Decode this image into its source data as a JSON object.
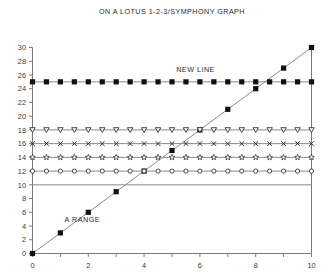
{
  "chart_data": {
    "type": "line",
    "title": "ON A LOTUS 1-2-3/SYMPHONY GRAPH",
    "xlabel": "",
    "ylabel": "",
    "xlim": [
      0,
      10
    ],
    "ylim": [
      0,
      30
    ],
    "grid": false,
    "legend_position": "none",
    "xticks": [
      0,
      1,
      2,
      3,
      4,
      5,
      6,
      7,
      8,
      9,
      10
    ],
    "xticklabels": [
      "0",
      "",
      "2",
      "",
      "4",
      "",
      "6",
      "",
      "8",
      "",
      "10"
    ],
    "yticks": [
      0,
      2,
      4,
      6,
      8,
      10,
      12,
      14,
      16,
      18,
      20,
      22,
      24,
      26,
      28,
      30
    ],
    "yticklabels": [
      "0",
      "2",
      "4",
      "6",
      "8",
      "10",
      "12",
      "14",
      "16",
      "18",
      "20",
      "22",
      "24",
      "26",
      "28",
      "30"
    ],
    "annotations": [
      {
        "text": "A RANGE",
        "x": 1.15,
        "y": 4.6
      },
      {
        "text": "NEW LINE",
        "x": 5.15,
        "y": 26.4
      }
    ],
    "series": [
      {
        "name": "A RANGE",
        "marker": "filled-square",
        "x": [
          0,
          1,
          2,
          3,
          4,
          5,
          6,
          7,
          8,
          9,
          10
        ],
        "values": [
          0,
          3,
          6,
          9,
          12,
          15,
          18,
          21,
          24,
          27,
          30
        ]
      },
      {
        "name": "NEW LINE",
        "marker": "filled-square",
        "x": [
          0,
          0.5,
          1,
          1.5,
          2,
          2.5,
          3,
          3.5,
          4,
          4.5,
          5,
          5.5,
          6,
          6.5,
          7,
          7.5,
          8,
          8.5,
          9,
          9.5,
          10
        ],
        "values": [
          25,
          25,
          25,
          25,
          25,
          25,
          25,
          25,
          25,
          25,
          25,
          25,
          25,
          25,
          25,
          25,
          25,
          25,
          25,
          25,
          25
        ]
      },
      {
        "name": "line-18",
        "marker": "down-triangle",
        "x": [
          0,
          0.5,
          1,
          1.5,
          2,
          2.5,
          3,
          3.5,
          4,
          4.5,
          5,
          5.5,
          6,
          6.5,
          7,
          7.5,
          8,
          8.5,
          9,
          9.5,
          10
        ],
        "values": [
          18,
          18,
          18,
          18,
          18,
          18,
          18,
          18,
          18,
          18,
          18,
          18,
          18,
          18,
          18,
          18,
          18,
          18,
          18,
          18,
          18
        ]
      },
      {
        "name": "line-16",
        "marker": "cross-x",
        "x": [
          0,
          0.5,
          1,
          1.5,
          2,
          2.5,
          3,
          3.5,
          4,
          4.5,
          5,
          5.5,
          6,
          6.5,
          7,
          7.5,
          8,
          8.5,
          9,
          9.5,
          10
        ],
        "values": [
          16,
          16,
          16,
          16,
          16,
          16,
          16,
          16,
          16,
          16,
          16,
          16,
          16,
          16,
          16,
          16,
          16,
          16,
          16,
          16,
          16
        ]
      },
      {
        "name": "line-14",
        "marker": "star",
        "x": [
          0,
          0.5,
          1,
          1.5,
          2,
          2.5,
          3,
          3.5,
          4,
          4.5,
          5,
          5.5,
          6,
          6.5,
          7,
          7.5,
          8,
          8.5,
          9,
          9.5,
          10
        ],
        "values": [
          14,
          14,
          14,
          14,
          14,
          14,
          14,
          14,
          14,
          14,
          14,
          14,
          14,
          14,
          14,
          14,
          14,
          14,
          14,
          14,
          14
        ]
      },
      {
        "name": "line-12",
        "marker": "open-circle",
        "x": [
          0,
          0.5,
          1,
          1.5,
          2,
          2.5,
          3,
          3.5,
          4,
          4.5,
          5,
          5.5,
          6,
          6.5,
          7,
          7.5,
          8,
          8.5,
          9,
          9.5,
          10
        ],
        "values": [
          12,
          12,
          12,
          12,
          12,
          12,
          12,
          12,
          12,
          12,
          12,
          12,
          12,
          12,
          12,
          12,
          12,
          12,
          12,
          12,
          12
        ]
      },
      {
        "name": "line-10",
        "marker": "none",
        "x": [
          0,
          10
        ],
        "values": [
          10,
          10
        ]
      }
    ],
    "colors": {
      "axis": "#7a7a7a",
      "line": "#8a8a8a",
      "marker_fill": "#111111",
      "text": "#2b2b2b",
      "background": "#ffffff"
    }
  }
}
